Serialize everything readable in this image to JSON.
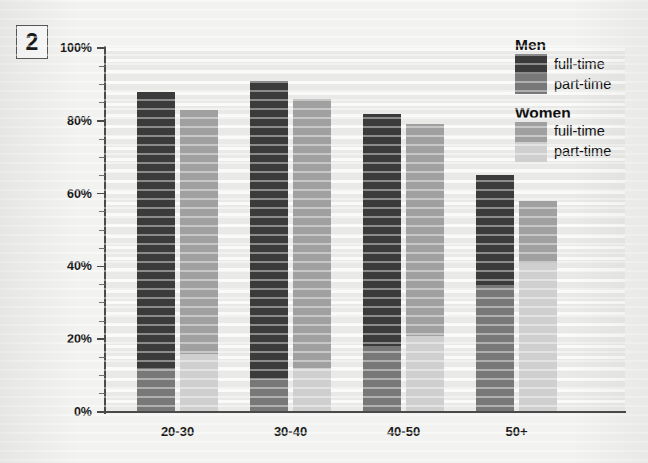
{
  "figure": {
    "number": "2"
  },
  "legend": {
    "groups": [
      {
        "title": "Men",
        "entries": [
          {
            "label": "full-time",
            "color": "#3b3b3b"
          },
          {
            "label": "part-time",
            "color": "#787878"
          }
        ]
      },
      {
        "title": "Women",
        "entries": [
          {
            "label": "full-time",
            "color": "#a0a0a0"
          },
          {
            "label": "part-time",
            "color": "#cfcfcf"
          }
        ]
      }
    ]
  },
  "axes": {
    "y_labels": [
      "100%",
      "80%",
      "60%",
      "40%",
      "20%",
      "0%"
    ],
    "y_label_values": [
      100,
      80,
      60,
      40,
      20,
      0
    ],
    "y_minor_step": 5,
    "x_labels": [
      "20-30",
      "30-40",
      "40-50",
      "50+"
    ]
  },
  "chart_data": {
    "type": "bar",
    "title": "",
    "subtitle": "",
    "xlabel": "",
    "ylabel": "",
    "ylim": [
      0,
      100
    ],
    "ytick_labels": [
      "0%",
      "20%",
      "40%",
      "60%",
      "80%",
      "100%"
    ],
    "yticks": [
      0,
      20,
      40,
      60,
      80,
      100
    ],
    "grid": true,
    "legend_position": "top-right",
    "stacked": true,
    "grouped": true,
    "categories": [
      "20-30",
      "30-40",
      "40-50",
      "50+"
    ],
    "series": [
      {
        "name": "Men full-time",
        "group": "Men",
        "color": "#3b3b3b",
        "values": [
          76,
          82,
          64,
          30
        ]
      },
      {
        "name": "Men part-time",
        "group": "Men",
        "color": "#787878",
        "values": [
          12,
          9,
          18,
          35
        ]
      },
      {
        "name": "Women full-time",
        "group": "Women",
        "color": "#a0a0a0",
        "values": [
          67,
          74,
          58,
          17
        ]
      },
      {
        "name": "Women part-time",
        "group": "Women",
        "color": "#cfcfcf",
        "values": [
          16,
          12,
          21,
          41
        ]
      }
    ],
    "bar_totals": {
      "men": [
        88,
        91,
        82,
        65
      ],
      "women": [
        83,
        86,
        79,
        58
      ]
    }
  },
  "colors": {
    "men_full_time": "#3b3b3b",
    "men_part_time": "#787878",
    "women_full_time": "#a0a0a0",
    "women_part_time": "#cfcfcf",
    "plot_background": "#e9e9e7",
    "page_background": "#f2f2f0",
    "axis": "#4a4a4a",
    "text": "#1a1a1a"
  }
}
